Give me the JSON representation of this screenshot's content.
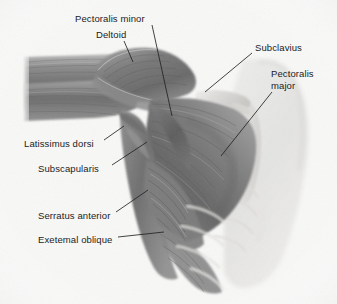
{
  "figure": {
    "type": "anatomical-illustration",
    "style": "grayscale pencil rendering",
    "background_color": "#f8f8f7",
    "label_color": "#1c1c1c",
    "leader_line_color": "#222222"
  },
  "labels": [
    {
      "id": "pectoralis-minor",
      "text": "Pectoralis minor",
      "x": 75,
      "y": 13,
      "lines": [
        "Pectoralis minor"
      ],
      "leader": {
        "x1": 152,
        "y1": 25,
        "x2": 172,
        "y2": 116
      }
    },
    {
      "id": "deltoid",
      "text": "Deltoid",
      "x": 96,
      "y": 29,
      "lines": [
        "Deltoid"
      ],
      "leader": {
        "x1": 124,
        "y1": 41,
        "x2": 133,
        "y2": 62
      }
    },
    {
      "id": "subclavius",
      "text": "Subclavius",
      "x": 255,
      "y": 42,
      "lines": [
        "Subclavius"
      ],
      "leader": {
        "x1": 252,
        "y1": 53,
        "x2": 205,
        "y2": 92
      }
    },
    {
      "id": "pectoralis-major",
      "text": "Pectoralis major",
      "x": 271,
      "y": 68,
      "lines": [
        "Pectoralis",
        "major"
      ],
      "leader": {
        "x1": 272,
        "y1": 92,
        "x2": 221,
        "y2": 156
      }
    },
    {
      "id": "latissimus-dorsi",
      "text": "Latissimus dorsi",
      "x": 24,
      "y": 138,
      "lines": [
        "Latissimus dorsi"
      ],
      "leader": {
        "x1": 104,
        "y1": 140,
        "x2": 124,
        "y2": 126
      }
    },
    {
      "id": "subscapularis",
      "text": "Subscapularis",
      "x": 38,
      "y": 163,
      "lines": [
        "Subscapularis"
      ],
      "leader": {
        "x1": 112,
        "y1": 165,
        "x2": 147,
        "y2": 142
      }
    },
    {
      "id": "serratus-anterior",
      "text": "Serratus anterior",
      "x": 38,
      "y": 210,
      "lines": [
        "Serratus anterior"
      ],
      "leader": {
        "x1": 116,
        "y1": 212,
        "x2": 148,
        "y2": 190
      }
    },
    {
      "id": "exetemal-oblique",
      "text": "Exetemal oblique",
      "x": 38,
      "y": 234,
      "lines": [
        "Exetemal oblique"
      ],
      "leader": {
        "x1": 118,
        "y1": 237,
        "x2": 164,
        "y2": 232
      }
    }
  ]
}
